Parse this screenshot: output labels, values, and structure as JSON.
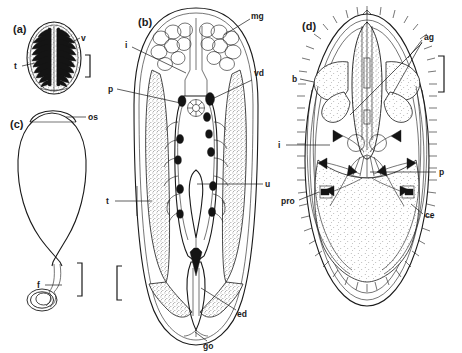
{
  "figure": {
    "kind": "scientific-line-drawing",
    "background_color": "#ffffff",
    "ink_color": "#1a1a1a",
    "panels": [
      {
        "id": "a",
        "panel_label": "(a)",
        "labels": [
          {
            "key": "v",
            "text": "v",
            "side": "right"
          },
          {
            "key": "t",
            "text": "t",
            "side": "left"
          }
        ],
        "scale_bar": {
          "present": true,
          "orientation": "vertical",
          "style": "right-bracket"
        }
      },
      {
        "id": "b",
        "panel_label": "(b)",
        "labels": [
          {
            "key": "mg",
            "text": "mg",
            "side": "right"
          },
          {
            "key": "i",
            "text": "i",
            "side": "left"
          },
          {
            "key": "p",
            "text": "p",
            "side": "left"
          },
          {
            "key": "vd",
            "text": "vd",
            "side": "right"
          },
          {
            "key": "t",
            "text": "t",
            "side": "left"
          },
          {
            "key": "u",
            "text": "u",
            "side": "right"
          },
          {
            "key": "ed",
            "text": "ed",
            "side": "right"
          },
          {
            "key": "go",
            "text": "go",
            "side": "bottom"
          }
        ],
        "scale_bar": {
          "present": true,
          "orientation": "vertical",
          "style": "left-bracket"
        }
      },
      {
        "id": "c",
        "panel_label": "(c)",
        "labels": [
          {
            "key": "os",
            "text": "os",
            "side": "right"
          },
          {
            "key": "f",
            "text": "f",
            "side": "left"
          }
        ],
        "scale_bar": {
          "present": true,
          "orientation": "vertical",
          "style": "left-bracket"
        }
      },
      {
        "id": "d",
        "panel_label": "(d)",
        "labels": [
          {
            "key": "ag",
            "text": "ag",
            "side": "right"
          },
          {
            "key": "b",
            "text": "b",
            "side": "left"
          },
          {
            "key": "p",
            "text": "p",
            "side": "right"
          },
          {
            "key": "i",
            "text": "i",
            "side": "left"
          },
          {
            "key": "pro",
            "text": "pro",
            "side": "left"
          },
          {
            "key": "ce",
            "text": "ce",
            "side": "right"
          }
        ],
        "scale_bar": {
          "present": true,
          "orientation": "vertical",
          "style": "right-bracket"
        }
      }
    ]
  }
}
